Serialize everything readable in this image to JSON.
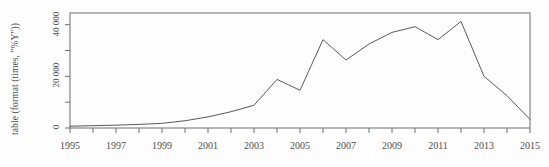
{
  "chart_data": {
    "type": "line",
    "title": "",
    "xlabel": "",
    "ylabel": "table (format (times, \"%Y\"))",
    "x": [
      1995,
      1996,
      1997,
      1998,
      1999,
      2000,
      2001,
      2002,
      2003,
      2004,
      2005,
      2006,
      2007,
      2008,
      2009,
      2010,
      2011,
      2012,
      2013,
      2014,
      2015
    ],
    "values": [
      700,
      900,
      1100,
      1400,
      1800,
      2800,
      4300,
      6300,
      8800,
      18800,
      14600,
      34200,
      26300,
      32500,
      37000,
      39200,
      34200,
      41200,
      20000,
      12500,
      3300
    ],
    "xlim": [
      1995,
      2015
    ],
    "ylim": [
      0,
      44500
    ],
    "grid": false,
    "legend": null,
    "line_color": "#5a5a5a",
    "frame_color": "#6e6e6e",
    "xticks_major": [
      1995,
      1997,
      1999,
      2001,
      2003,
      2005,
      2007,
      2009,
      2011,
      2013,
      2015
    ],
    "xticks_all": [
      1995,
      1996,
      1997,
      1998,
      1999,
      2000,
      2001,
      2002,
      2003,
      2004,
      2005,
      2006,
      2007,
      2008,
      2009,
      2010,
      2011,
      2012,
      2013,
      2014,
      2015
    ],
    "xtick_labels": [
      "1995",
      "1997",
      "1999",
      "2001",
      "2003",
      "2005",
      "2007",
      "2009",
      "2011",
      "2013",
      "2015"
    ],
    "yticks_major": [
      0,
      20000,
      40000
    ],
    "ytick_labels": [
      "0",
      "20 000",
      "40 000"
    ],
    "yticks_minor": [
      10000,
      30000
    ]
  }
}
